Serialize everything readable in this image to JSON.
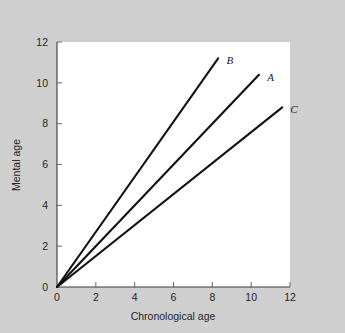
{
  "figure": {
    "background_color": "#cfcfcf",
    "plot_background_color": "#ffffff",
    "line_color": "#111111",
    "axis_color": "#3a3a3a"
  },
  "chart_data": {
    "type": "line",
    "title": "",
    "xlabel": "Chronological age",
    "ylabel": "Mental age",
    "xlim": [
      0,
      12
    ],
    "ylim": [
      0,
      12
    ],
    "xticks": [
      0,
      2,
      4,
      6,
      8,
      10,
      12
    ],
    "yticks": [
      0,
      2,
      4,
      6,
      8,
      10,
      12
    ],
    "xtick_labels": [
      "0",
      "2",
      "4",
      "6",
      "8",
      "10",
      "12"
    ],
    "ytick_labels": [
      "0",
      "2",
      "4",
      "6",
      "8",
      "10",
      "12"
    ],
    "grid": false,
    "legend_position": "inline-end-of-line",
    "series": [
      {
        "name": "B",
        "label": "B",
        "slope": 1.35,
        "x": [
          0,
          8.3
        ],
        "y": [
          0,
          11.2
        ],
        "label_x": 8.9,
        "label_y": 10.9
      },
      {
        "name": "A",
        "label": "A",
        "slope": 1.0,
        "x": [
          0,
          10.4
        ],
        "y": [
          0,
          10.4
        ],
        "label_x": 11.0,
        "label_y": 10.1
      },
      {
        "name": "C",
        "label": "C",
        "slope": 0.76,
        "x": [
          0,
          11.6
        ],
        "y": [
          0,
          8.8
        ],
        "label_x": 12.2,
        "label_y": 8.5
      }
    ]
  }
}
